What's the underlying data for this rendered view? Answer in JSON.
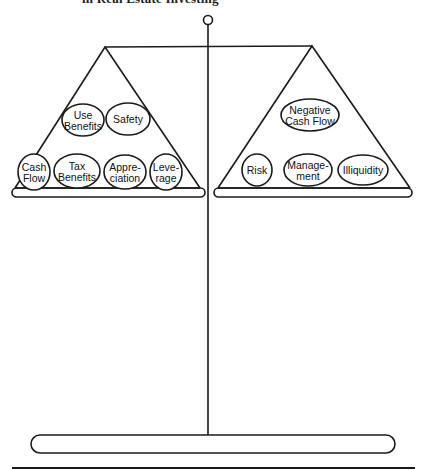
{
  "title": "in Real Estate Investing",
  "left_pan": {
    "name": "benefits",
    "items": [
      {
        "lines": [
          "Use",
          "Benefits"
        ],
        "cx": 83,
        "cy": 120,
        "rx": 21,
        "ry": 16
      },
      {
        "lines": [
          "Safety"
        ],
        "cx": 128,
        "cy": 119,
        "rx": 22,
        "ry": 16
      },
      {
        "lines": [
          "Cash",
          "Flow"
        ],
        "cx": 34,
        "cy": 172,
        "rx": 16,
        "ry": 18
      },
      {
        "lines": [
          "Tax",
          "Benefits"
        ],
        "cx": 77,
        "cy": 171,
        "rx": 23,
        "ry": 17
      },
      {
        "lines": [
          "Appre-",
          "ciation"
        ],
        "cx": 125,
        "cy": 172,
        "rx": 21,
        "ry": 17
      },
      {
        "lines": [
          "Leve-",
          "rage"
        ],
        "cx": 166,
        "cy": 172,
        "rx": 16,
        "ry": 18
      }
    ]
  },
  "right_pan": {
    "name": "drawbacks",
    "items": [
      {
        "lines": [
          "Negative",
          "Cash Flow"
        ],
        "cx": 310,
        "cy": 115,
        "rx": 29,
        "ry": 16
      },
      {
        "lines": [
          "Risk"
        ],
        "cx": 257,
        "cy": 170,
        "rx": 15,
        "ry": 16
      },
      {
        "lines": [
          "Manage-",
          "ment"
        ],
        "cx": 308,
        "cy": 170,
        "rx": 24,
        "ry": 16
      },
      {
        "lines": [
          "Illiquidity"
        ],
        "cx": 363,
        "cy": 170,
        "rx": 25,
        "ry": 15
      }
    ]
  },
  "colors": {
    "stroke": "#1a1a1a",
    "background": "#ffffff"
  }
}
